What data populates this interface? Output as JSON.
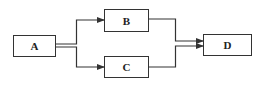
{
  "diagram": {
    "type": "flow",
    "nodes": [
      {
        "id": "A",
        "label": "A",
        "x": 13,
        "y": 35,
        "w": 42,
        "h": 21
      },
      {
        "id": "B",
        "label": "B",
        "x": 104,
        "y": 9,
        "w": 44,
        "h": 22
      },
      {
        "id": "C",
        "label": "C",
        "x": 104,
        "y": 56,
        "w": 44,
        "h": 21
      },
      {
        "id": "D",
        "label": "D",
        "x": 203,
        "y": 34,
        "w": 48,
        "h": 21
      }
    ],
    "edges": [
      {
        "from": "A",
        "to": "B"
      },
      {
        "from": "A",
        "to": "C"
      },
      {
        "from": "B",
        "to": "D"
      },
      {
        "from": "C",
        "to": "D"
      }
    ],
    "colors": {
      "stroke": "#333333",
      "text": "#222222",
      "background": "#ffffff"
    }
  }
}
